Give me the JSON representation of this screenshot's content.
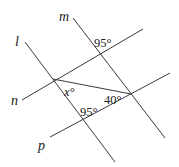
{
  "diagram": {
    "type": "geometry",
    "line_color": "#3a3a3a",
    "lines": [
      {
        "id": "l",
        "label": "l",
        "x1": 25,
        "y1": 42,
        "x2": 115,
        "y2": 162
      },
      {
        "id": "m",
        "label": "m",
        "x1": 73,
        "y1": 18,
        "x2": 165,
        "y2": 138
      },
      {
        "id": "n",
        "label": "n",
        "x1": 22,
        "y1": 100,
        "x2": 143,
        "y2": 29
      },
      {
        "id": "p",
        "label": "p",
        "x1": 50,
        "y1": 137,
        "x2": 170,
        "y2": 73
      }
    ],
    "segment": {
      "label": "transversal",
      "x1": 53,
      "y1": 79,
      "x2": 131,
      "y2": 94
    },
    "line_labels": {
      "l": "l",
      "m": "m",
      "n": "n",
      "p": "p"
    },
    "angle_labels": {
      "top_95": "95°",
      "x": "x°",
      "forty": "40°",
      "bottom_95": "95°"
    }
  }
}
